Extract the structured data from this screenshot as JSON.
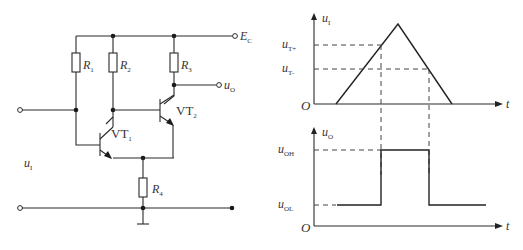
{
  "circuit": {
    "supply": {
      "symbol": "E",
      "sub": "C"
    },
    "resistors": [
      {
        "symbol": "R",
        "sub": "1"
      },
      {
        "symbol": "R",
        "sub": "2"
      },
      {
        "symbol": "R",
        "sub": "3"
      },
      {
        "symbol": "R",
        "sub": "4"
      }
    ],
    "transistors": [
      {
        "symbol": "VT",
        "sub": "1"
      },
      {
        "symbol": "VT",
        "sub": "2"
      }
    ],
    "input": {
      "symbol": "u",
      "sub": "I"
    },
    "output": {
      "symbol": "u",
      "sub": "O"
    }
  },
  "waveforms": {
    "input_plot": {
      "ylabel": {
        "symbol": "u",
        "sub": "I"
      },
      "xlabel": "t",
      "origin": "O",
      "levels": [
        {
          "symbol": "u",
          "sub": "T+"
        },
        {
          "symbol": "u",
          "sub": "T-"
        }
      ]
    },
    "output_plot": {
      "ylabel": {
        "symbol": "u",
        "sub": "O"
      },
      "xlabel": "t",
      "origin": "O",
      "levels": [
        {
          "symbol": "u",
          "sub": "OH"
        },
        {
          "symbol": "u",
          "sub": "OL"
        }
      ]
    }
  }
}
